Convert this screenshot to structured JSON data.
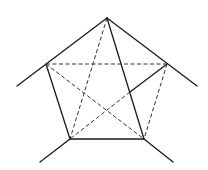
{
  "figure": {
    "vertices": {
      "top": [
        107,
        18
      ],
      "left": [
        46,
        64
      ],
      "right": [
        167,
        64
      ],
      "bottom_left": [
        70,
        139
      ],
      "bottom_right": [
        144,
        139
      ]
    },
    "solid_lines": [
      {
        "name": "top-left-extended",
        "from": [
          107,
          18
        ],
        "to": [
          17,
          86
        ]
      },
      {
        "name": "top-right-extended",
        "from": [
          107,
          18
        ],
        "to": [
          197,
          86
        ]
      },
      {
        "name": "left-to-bottom-left",
        "from": [
          46,
          64
        ],
        "to": [
          70,
          139
        ]
      },
      {
        "name": "bottom-edge",
        "from": [
          70,
          139
        ],
        "to": [
          144,
          139
        ]
      },
      {
        "name": "top-to-bottom-right",
        "from": [
          107,
          18
        ],
        "to": [
          144,
          139
        ]
      },
      {
        "name": "right-to-crossing",
        "from": [
          167,
          64
        ],
        "to": [
          130,
          92
        ]
      },
      {
        "name": "bottom-left-extension",
        "from": [
          70,
          139
        ],
        "to": [
          40,
          162
        ]
      },
      {
        "name": "bottom-right-extension",
        "from": [
          144,
          139
        ],
        "to": [
          173,
          162
        ]
      }
    ],
    "dashed_lines": [
      {
        "name": "left-to-right",
        "from": [
          46,
          64
        ],
        "to": [
          167,
          64
        ]
      },
      {
        "name": "top-to-bottom-left",
        "from": [
          107,
          18
        ],
        "to": [
          70,
          139
        ]
      },
      {
        "name": "left-to-bottom-right",
        "from": [
          46,
          64
        ],
        "to": [
          144,
          139
        ]
      },
      {
        "name": "right-to-bottom-right",
        "from": [
          167,
          64
        ],
        "to": [
          144,
          139
        ]
      },
      {
        "name": "crossing-to-bottom-left",
        "from": [
          130,
          92
        ],
        "to": [
          70,
          139
        ]
      }
    ]
  }
}
